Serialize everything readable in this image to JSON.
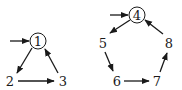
{
  "diagram": {
    "graphs": [
      {
        "name": "left-cycle",
        "start_node": "1",
        "nodes": [
          {
            "id": "1",
            "label": "1",
            "x": 38,
            "y": 41,
            "circled": true
          },
          {
            "id": "2",
            "label": "2",
            "x": 10,
            "y": 81,
            "circled": false
          },
          {
            "id": "3",
            "label": "3",
            "x": 63,
            "y": 81,
            "circled": false
          }
        ],
        "edges": [
          [
            "1",
            "2"
          ],
          [
            "2",
            "3"
          ],
          [
            "3",
            "1"
          ]
        ]
      },
      {
        "name": "right-cycle",
        "start_node": "4",
        "nodes": [
          {
            "id": "4",
            "label": "4",
            "x": 137,
            "y": 15,
            "circled": true
          },
          {
            "id": "5",
            "label": "5",
            "x": 103,
            "y": 43,
            "circled": false
          },
          {
            "id": "6",
            "label": "6",
            "x": 117,
            "y": 81,
            "circled": false
          },
          {
            "id": "7",
            "label": "7",
            "x": 157,
            "y": 81,
            "circled": false
          },
          {
            "id": "8",
            "label": "8",
            "x": 169,
            "y": 43,
            "circled": false
          }
        ],
        "edges": [
          [
            "4",
            "5"
          ],
          [
            "5",
            "6"
          ],
          [
            "6",
            "7"
          ],
          [
            "7",
            "8"
          ],
          [
            "8",
            "4"
          ]
        ]
      }
    ],
    "color": "#1a1a1a"
  }
}
